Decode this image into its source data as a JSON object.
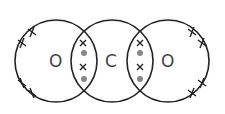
{
  "diagram": {
    "atoms": [
      {
        "label": "O",
        "cx": 56,
        "cy": 61
      },
      {
        "label": "C",
        "cx": 112,
        "cy": 61
      },
      {
        "label": "O",
        "cx": 168,
        "cy": 61
      }
    ],
    "colors": {
      "stroke": "#222222",
      "dot": "#888888",
      "text": "#444444"
    }
  }
}
